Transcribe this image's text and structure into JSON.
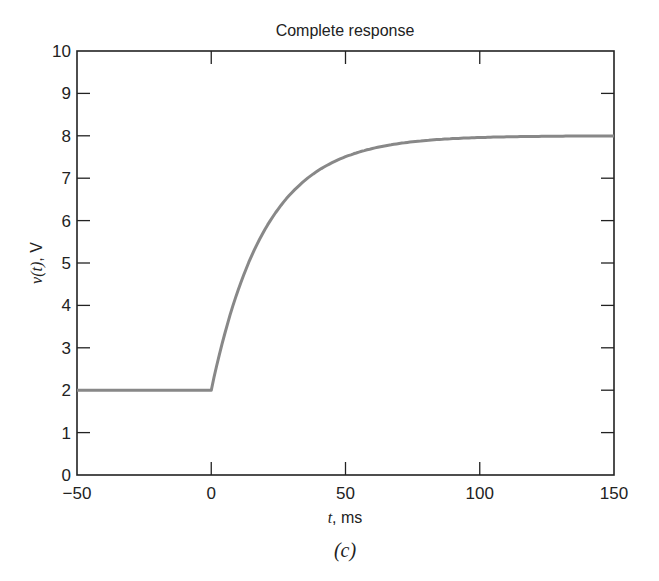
{
  "chart_data": {
    "type": "line",
    "title": "Complete response",
    "xlabel": "t, ms",
    "xlabel_var": "t",
    "xlabel_unit": ", ms",
    "ylabel": "v(t), V",
    "ylabel_var": "v(t)",
    "ylabel_unit": ", V",
    "caption": "(c)",
    "xlim": [
      -50,
      150
    ],
    "ylim": [
      0,
      10
    ],
    "xticks": [
      -50,
      0,
      50,
      100,
      150
    ],
    "xtick_labels": [
      "−50",
      "0",
      "50",
      "100",
      "150"
    ],
    "yticks": [
      0,
      1,
      2,
      3,
      4,
      5,
      6,
      7,
      8,
      9,
      10
    ],
    "ytick_labels": [
      "0",
      "1",
      "2",
      "3",
      "4",
      "5",
      "6",
      "7",
      "8",
      "9",
      "10"
    ],
    "grid": false,
    "legend": null,
    "line_color": "#888888",
    "series": [
      {
        "name": "v(t)",
        "x": [
          -50,
          -25,
          0,
          5,
          10,
          15,
          20,
          25,
          30,
          40,
          50,
          60,
          70,
          80,
          90,
          100,
          120,
          150
        ],
        "values": [
          2,
          2,
          2,
          3.33,
          4.36,
          5.17,
          5.79,
          6.28,
          6.66,
          7.19,
          7.51,
          7.7,
          7.82,
          7.89,
          7.93,
          7.96,
          7.99,
          8.0
        ]
      }
    ],
    "annotations": [
      "v(t) = 8 − 6e^(−t/20 ms) for t ≥ 0; v(t) = 2 V for t < 0"
    ]
  }
}
